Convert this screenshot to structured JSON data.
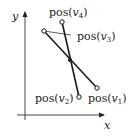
{
  "diagram": {
    "axes": {
      "x_label": "x",
      "y_label": "y",
      "color": "#222222"
    },
    "segments": [
      {
        "from": "v3",
        "to": "v1"
      },
      {
        "from": "v4",
        "to": "v2"
      }
    ],
    "points": [
      {
        "id": "v1",
        "label_prefix": "pos(",
        "var": "v",
        "sub": "1",
        "label_suffix": ")"
      },
      {
        "id": "v2",
        "label_prefix": "pos(",
        "var": "v",
        "sub": "2",
        "label_suffix": ")"
      },
      {
        "id": "v3",
        "label_prefix": "pos(",
        "var": "v",
        "sub": "3",
        "label_suffix": ")"
      },
      {
        "id": "v4",
        "label_prefix": "pos(",
        "var": "v",
        "sub": "4",
        "label_suffix": ")"
      }
    ],
    "intersection": {
      "marker": "filled-dot"
    },
    "line_color": "#1a1a1a"
  }
}
